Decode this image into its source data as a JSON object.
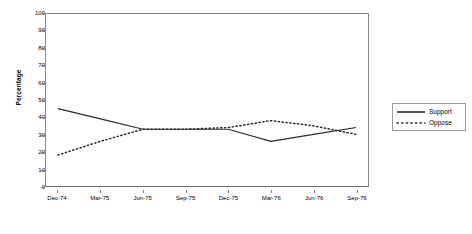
{
  "chart_data": {
    "type": "line",
    "title": "",
    "xlabel": "",
    "ylabel": "Percentage",
    "ylim": [
      0,
      100
    ],
    "ytick_step": 10,
    "yticks": [
      100,
      90,
      80,
      70,
      60,
      50,
      40,
      30,
      20,
      10,
      0
    ],
    "grid": false,
    "legend_position": "right",
    "categories": [
      "Dec-74",
      "Mar-75",
      "Jun-75",
      "Sep-75",
      "Dec-75",
      "Mar-76",
      "Jun-76",
      "Sep-76"
    ],
    "series": [
      {
        "name": "Support",
        "style": "solid",
        "color": "#2b2b2b",
        "values": [
          45,
          39,
          33,
          33,
          33,
          26,
          30,
          34
        ]
      },
      {
        "name": "Oppose",
        "style": "dotted",
        "color": "#2b2b2b",
        "values": [
          18,
          26,
          33,
          33,
          34,
          38,
          35,
          30
        ]
      }
    ]
  },
  "legend": {
    "entries": [
      {
        "label": "Support"
      },
      {
        "label": "Oppose"
      }
    ]
  },
  "axis": {
    "y_title": "Percentage"
  },
  "colors": {
    "line": "#2b2b2b",
    "axis": "#8a8a8a",
    "background": "#ffffff"
  }
}
